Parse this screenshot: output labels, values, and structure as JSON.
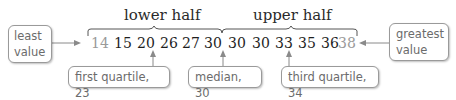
{
  "labels": {
    "lower_half": "lower half",
    "upper_half": "upper half"
  },
  "data_values": [
    "14",
    "15",
    "20",
    "26",
    "27",
    "30",
    "30",
    "30",
    "33",
    "35",
    "36",
    "38"
  ],
  "callouts": {
    "least_value_line1": "least",
    "least_value_line2": "value",
    "greatest_value_line1": "greatest",
    "greatest_value_line2": "value",
    "first_quartile": "first quartile, 23",
    "median": "median, 30",
    "third_quartile": "third quartile, 34"
  },
  "colors": {
    "callout_border": "#9a9a9a",
    "callout_text": "#6b6b6b",
    "number_text": "#1e1e1e",
    "extreme_number_text": "#9a9a9a",
    "arrow": "#8a8a8a"
  }
}
